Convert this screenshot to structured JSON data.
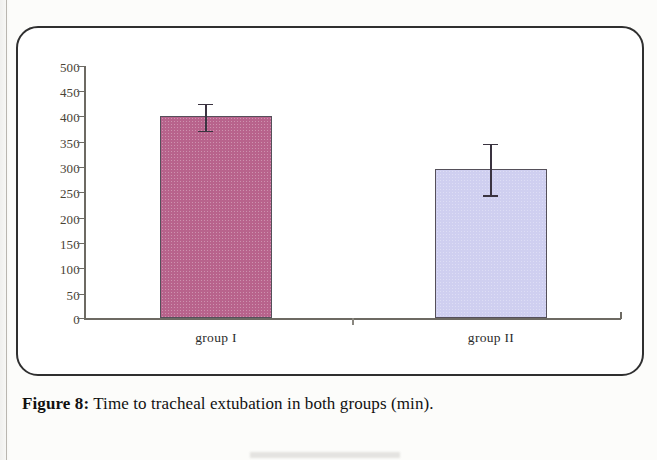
{
  "caption": {
    "figure_label": "Figure 8:",
    "text": " Time to tracheal extubation in both groups (min)."
  },
  "chart_data": {
    "type": "bar",
    "title": "",
    "xlabel": "",
    "ylabel": "",
    "categories": [
      "group I",
      "group II"
    ],
    "values": [
      400,
      296
    ],
    "errors_low": [
      372,
      244
    ],
    "errors_high": [
      425,
      346
    ],
    "colors": [
      "#b8638c",
      "#cfcff0"
    ],
    "ylim": [
      0,
      500
    ],
    "yticks": [
      0,
      50,
      100,
      150,
      200,
      250,
      300,
      350,
      400,
      450,
      500
    ],
    "ytick_labels": [
      "0",
      "50",
      "100",
      "150",
      "200",
      "250",
      "300",
      "350",
      "400",
      "450",
      "500"
    ],
    "grid": false,
    "legend": "none",
    "units": "min"
  },
  "axis": {
    "tick_0": "0",
    "tick_50": "50",
    "tick_100": "100",
    "tick_150": "150",
    "tick_200": "200",
    "tick_250": "250",
    "tick_300": "300",
    "tick_350": "350",
    "tick_400": "400",
    "tick_450": "450",
    "tick_500": "500"
  },
  "labels": {
    "group1": "group I",
    "group2": "group II"
  }
}
